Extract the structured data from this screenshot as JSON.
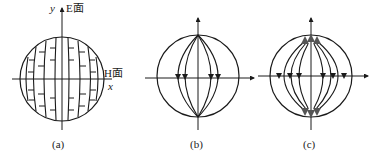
{
  "figure": {
    "panels": [
      {
        "id": "a",
        "caption": "(a)",
        "y_axis_label": "y",
        "e_plane_label": "E面",
        "h_plane_label": "H面",
        "x_axis_label": "x",
        "description": "Sphere with vertical meridian field lines and short horizontal tick marks (E-field pattern)"
      },
      {
        "id": "b",
        "caption": "(b)",
        "description": "Sphere with meridian field lines converging at poles, downward arrows on equator"
      },
      {
        "id": "c",
        "caption": "(c)",
        "description": "Sphere with curved field lines bowing outward, arrows at poles and along equator"
      }
    ],
    "colors": {
      "line": "#1a1a1a",
      "arrow": "#1a1a1a",
      "polar_arrow": "#555555",
      "background": "#ffffff"
    }
  }
}
